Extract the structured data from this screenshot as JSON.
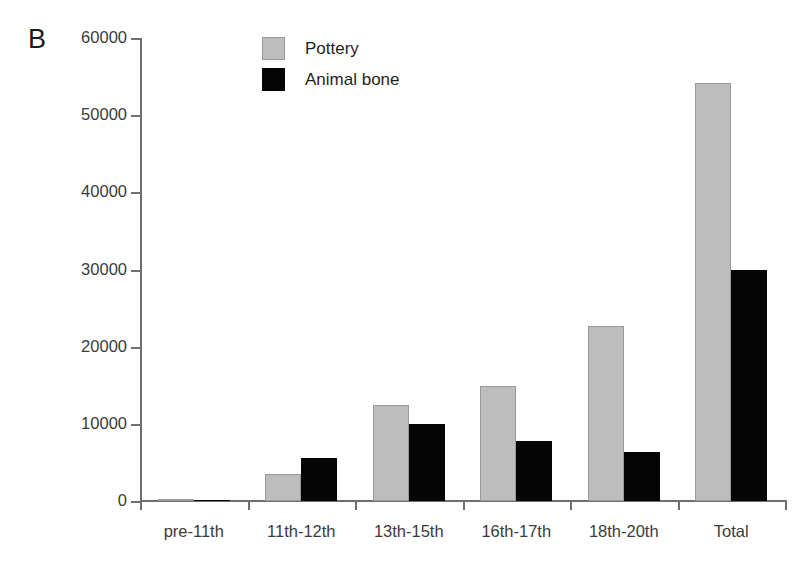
{
  "panel": {
    "label": "B"
  },
  "legend": {
    "position": "top-left-inside",
    "items": [
      {
        "label": "Pottery",
        "swatch": "pottery-swatch",
        "color": "#bdbdbd"
      },
      {
        "label": "Animal bone",
        "swatch": "animal-bone-swatch",
        "color": "#050505"
      }
    ]
  },
  "axis": {
    "y_ticks": [
      "60000",
      "50000",
      "40000",
      "30000",
      "20000",
      "10000",
      "0"
    ],
    "x_labels": [
      "pre-11th",
      "11th-12th",
      "13th-15th",
      "16th-17th",
      "18th-20th",
      "Total"
    ]
  },
  "chart_data": {
    "type": "bar",
    "title": "B",
    "xlabel": "",
    "ylabel": "",
    "ylim": [
      0,
      60000
    ],
    "ytick_step": 10000,
    "grid": false,
    "legend_position": "upper left (inside plot)",
    "categories": [
      "pre-11th",
      "11th-12th",
      "13th-15th",
      "16th-17th",
      "18th-20th",
      "Total"
    ],
    "series": [
      {
        "name": "Pottery",
        "color": "#bdbdbd",
        "values": [
          200,
          3500,
          12400,
          14900,
          22700,
          54200
        ]
      },
      {
        "name": "Animal bone",
        "color": "#050505",
        "values": [
          60,
          5600,
          10000,
          7800,
          6400,
          29900
        ]
      }
    ]
  }
}
